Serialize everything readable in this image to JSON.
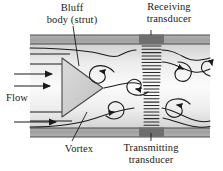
{
  "figure": {
    "name": "vortex-shedding-flowmeter-diagram",
    "type": "schematic",
    "width": 223,
    "height": 171,
    "background_color": "#ffffff",
    "line_color": "#1a1a1a"
  },
  "labels": {
    "bluff_body": "Bluff\nbody (strut)",
    "bluff_body_line1": "Bluff",
    "bluff_body_line2": "body (strut)",
    "receiving_transducer_line1": "Receiving",
    "receiving_transducer_line2": "transducer",
    "flow": "Flow",
    "vortex": "Vortex",
    "transmitting_transducer_line1": "Transmitting",
    "transmitting_transducer_line2": "transducer"
  },
  "pipe": {
    "left": 30,
    "right": 210,
    "top_wall_y": 36,
    "bottom_wall_y": 128,
    "wall_thickness": 9,
    "wall_fill": "#a8a8a8",
    "interior_fill": "#e6e6e6",
    "interior_highlight": "#f7f7f7"
  },
  "bluff_body": {
    "shape": "triangle",
    "apex_direction": "right",
    "fill": "#cfcfcf",
    "stroke": "#555555",
    "points": "62,58 62,117 103,88"
  },
  "transducers": {
    "receiving": {
      "position": "top-wall",
      "x": 139,
      "y": 34,
      "width": 25,
      "height": 9,
      "fill": "#6f6f6f"
    },
    "transmitting": {
      "position": "bottom-wall",
      "x": 139,
      "y": 128,
      "width": 25,
      "height": 9,
      "fill": "#6f6f6f"
    }
  },
  "ultrasonic_beam": {
    "description": "stack of horizontal rungs spanning pipe between transducers",
    "x_center": 151,
    "rung_count": 24,
    "top_y": 45,
    "bottom_y": 126,
    "color": "#2b2b2b"
  },
  "flow_arrows": {
    "count": 3,
    "direction": "right",
    "color": "#1a1a1a"
  },
  "vortices": {
    "count": 6,
    "description": "alternating clockwise and counter-clockwise curl spirals downstream of bluff body"
  },
  "colors": {
    "wall": "#a8a8a8",
    "interior": "#e6e6e6",
    "transducer": "#6f6f6f",
    "bluff_body": "#cfcfcf",
    "ink": "#1a1a1a"
  }
}
